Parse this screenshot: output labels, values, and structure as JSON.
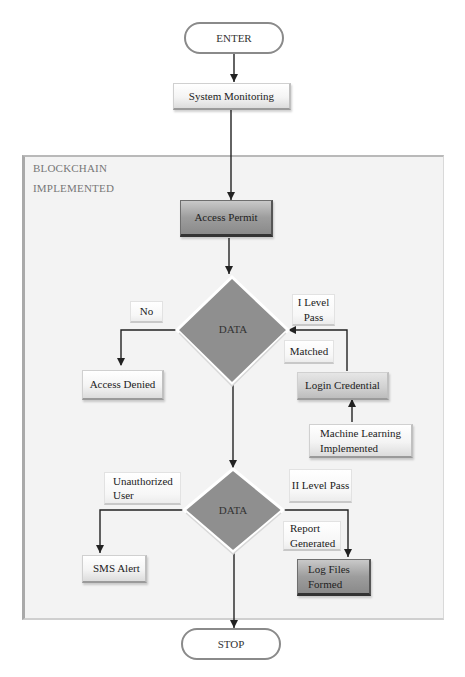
{
  "diagram": {
    "type": "flowchart",
    "start": {
      "label": "ENTER"
    },
    "stop": {
      "label": "STOP"
    },
    "container": {
      "title_line1": "BLOCKCHAIN",
      "title_line2": "IMPLEMENTED"
    },
    "nodes": {
      "system_monitoring": "System Monitoring",
      "access_permit": "Access Permit",
      "decision1": "DATA",
      "decision2": "DATA",
      "access_denied": "Access Denied",
      "login_credential": "Login Credential",
      "ml_line1": "Machine Learning",
      "ml_line2": "Implemented",
      "sms_alert": "SMS Alert",
      "log_files_line1": "Log Files",
      "log_files_line2": "Formed"
    },
    "edge_labels": {
      "no": "No",
      "level1_line1": "I Level",
      "level1_line2": "Pass",
      "matched": "Matched",
      "unauth_line1": "Unauthorized",
      "unauth_line2": "User",
      "level2": "II Level Pass",
      "report_line1": "Report",
      "report_line2": "Generated"
    },
    "colors": {
      "diamond_fill": "#8f8f8f",
      "diamond_border": "#ffffff",
      "arrow": "#222222",
      "container_bg": "#f3f3f3"
    },
    "edges": [
      [
        "ENTER",
        "System Monitoring"
      ],
      [
        "System Monitoring",
        "Access Permit"
      ],
      [
        "Access Permit",
        "DATA (1)"
      ],
      [
        "DATA (1)",
        "Access Denied",
        "No"
      ],
      [
        "Machine Learning Implemented",
        "Login Credential"
      ],
      [
        "Login Credential",
        "DATA (1)",
        "Matched / I Level Pass"
      ],
      [
        "DATA (1)",
        "DATA (2)"
      ],
      [
        "DATA (2)",
        "SMS Alert",
        "Unauthorized User"
      ],
      [
        "DATA (2)",
        "Log Files Formed",
        "II Level Pass / Report Generated"
      ],
      [
        "DATA (2)",
        "STOP"
      ]
    ]
  }
}
